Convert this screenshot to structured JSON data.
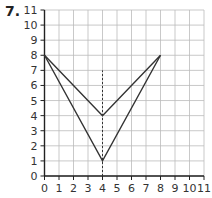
{
  "question_number": "7.",
  "grid": {
    "x_min": 0,
    "x_max": 11,
    "y_min": 0,
    "y_max": 11,
    "x_ticks": [
      "0",
      "1",
      "2",
      "3",
      "4",
      "5",
      "6",
      "7",
      "8",
      "9",
      "10",
      "11"
    ],
    "y_ticks": [
      "0",
      "1",
      "2",
      "3",
      "4",
      "5",
      "6",
      "7",
      "8",
      "9",
      "10",
      "11"
    ]
  },
  "shape": {
    "outer_polyline": [
      [
        0,
        8
      ],
      [
        4,
        1
      ],
      [
        8,
        8
      ]
    ],
    "inner_polyline": [
      [
        0,
        8
      ],
      [
        4,
        4
      ],
      [
        8,
        8
      ]
    ],
    "mirror_line_x": 4,
    "mirror_line_y_range": [
      0,
      7
    ],
    "line_color": "#333333",
    "grid_color": "#bbbbbb"
  }
}
